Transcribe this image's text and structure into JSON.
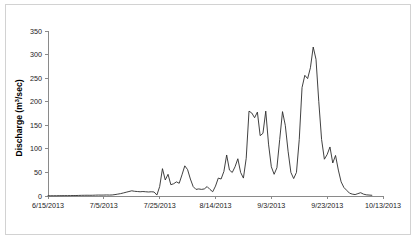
{
  "chart_data": {
    "type": "line",
    "title": "",
    "xlabel": "",
    "ylabel": "Discharge (m3/sec)",
    "ylabel_parts": {
      "prefix": "Discharge (m",
      "superscript": "3",
      "suffix": "/sec)"
    },
    "grid": false,
    "legend": "none",
    "ylim": [
      0,
      350
    ],
    "ytick_labels": [
      "0",
      "50",
      "100",
      "150",
      "200",
      "250",
      "300",
      "350"
    ],
    "yticks": [
      0,
      50,
      100,
      150,
      200,
      250,
      300,
      350
    ],
    "xtick_labels": [
      "6/15/2013",
      "7/5/2013",
      "7/25/2013",
      "8/14/2013",
      "9/3/2013",
      "9/23/2013",
      "10/13/2013"
    ],
    "xticks_day_index": [
      0,
      20,
      40,
      60,
      80,
      100,
      120
    ],
    "xlim_days": [
      0,
      120
    ],
    "x_start_date": "6/15/2013",
    "x_end_date": "10/13/2013",
    "series": [
      {
        "name": "Discharge",
        "color": "#2b2b2b",
        "x": [
          0,
          1,
          2,
          3,
          4,
          5,
          6,
          7,
          8,
          9,
          10,
          11,
          12,
          13,
          14,
          15,
          16,
          17,
          18,
          19,
          20,
          21,
          22,
          23,
          24,
          25,
          26,
          27,
          28,
          29,
          30,
          31,
          32,
          33,
          34,
          35,
          36,
          37,
          38,
          39,
          40,
          41,
          42,
          43,
          44,
          45,
          46,
          47,
          48,
          49,
          50,
          51,
          52,
          53,
          54,
          55,
          56,
          57,
          58,
          59,
          60,
          61,
          62,
          63,
          64,
          65,
          66,
          67,
          68,
          69,
          70,
          71,
          72,
          73,
          74,
          75,
          76,
          77,
          78,
          79,
          80,
          81,
          82,
          83,
          84,
          85,
          86,
          87,
          88,
          89,
          90,
          91,
          92,
          93,
          94,
          95,
          96,
          97,
          98,
          99,
          100,
          101,
          102,
          103,
          104,
          105,
          106
        ],
        "values": [
          0.5,
          0.5,
          0.6,
          0.6,
          0.7,
          0.7,
          0.8,
          0.8,
          0.9,
          1.0,
          1.0,
          1.2,
          1.4,
          1.5,
          1.6,
          1.5,
          1.6,
          1.8,
          2.0,
          1.9,
          2.0,
          2.2,
          2.0,
          2.2,
          3.0,
          4.0,
          5.0,
          6.5,
          8.0,
          9.5,
          11.0,
          10.0,
          9.5,
          9.0,
          9.5,
          9.0,
          8.5,
          9.0,
          8.5,
          2.0,
          20.0,
          58.0,
          34.0,
          46.0,
          24.0,
          26.0,
          30.0,
          27.0,
          45.0,
          64.0,
          56.0,
          36.0,
          20.0,
          14.0,
          15.0,
          14.0,
          15.0,
          20.0,
          14.0,
          9.0,
          21.0,
          38.0,
          36.0,
          52.0,
          87.0,
          55.0,
          50.0,
          62.0,
          79.0,
          50.0,
          38.0,
          80.0,
          180.0,
          176.0,
          166.0,
          178.0,
          128.0,
          133.0,
          180.0,
          110.0,
          62.0,
          46.0,
          60.0,
          120.0,
          179.0,
          150.0,
          95.0,
          50.0,
          37.0,
          50.0,
          120.0,
          230.0,
          256.0,
          249.0,
          272.0,
          316.0,
          290.0,
          200.0,
          120.0,
          78.0,
          88.0,
          104.0,
          70.0,
          86.0,
          55.0,
          30.0,
          18.0
        ],
        "tail_values": [
          12.0,
          6.0,
          4.0,
          3.0,
          5.0,
          7.0,
          4.0,
          2.5,
          2.0,
          1.5
        ]
      }
    ],
    "annotations": []
  },
  "figure": {
    "border_color": "#d2d2d2",
    "axis_color": "#8a8a8a",
    "line_color": "#2b2b2b",
    "background": "#ffffff"
  }
}
